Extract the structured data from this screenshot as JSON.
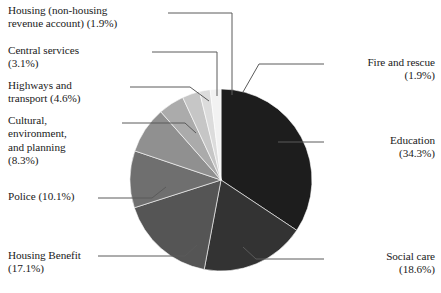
{
  "chart_data": {
    "type": "pie",
    "title": "",
    "legend_position": "callout-labels",
    "grid": false,
    "categories": [
      "Education",
      "Social care",
      "Housing Benefit",
      "Police",
      "Cultural, environment, and planning",
      "Highways and transport",
      "Central services",
      "Housing (non-housing revenue account)",
      "Fire and rescue"
    ],
    "values": [
      34.3,
      18.6,
      17.1,
      10.1,
      8.3,
      4.6,
      3.1,
      1.9,
      1.9
    ],
    "unit": "%",
    "slices": [
      {
        "label": "Education",
        "value": 34.3,
        "color": "#1d1d1d",
        "start_angle": 0,
        "end_angle": 123.48
      },
      {
        "label": "Social care",
        "value": 18.6,
        "color": "#333333",
        "start_angle": 123.48,
        "end_angle": 190.44
      },
      {
        "label": "Housing Benefit",
        "value": 17.1,
        "color": "#555555",
        "start_angle": 190.44,
        "end_angle": 252.0
      },
      {
        "label": "Police",
        "value": 10.1,
        "color": "#6f6f6f",
        "start_angle": 252.0,
        "end_angle": 288.36
      },
      {
        "label": "Cultural, environment, and planning",
        "value": 8.3,
        "color": "#909090",
        "start_angle": 288.36,
        "end_angle": 318.24
      },
      {
        "label": "Highways and transport",
        "value": 4.6,
        "color": "#ababab",
        "start_angle": 318.24,
        "end_angle": 334.8
      },
      {
        "label": "Central services",
        "value": 3.1,
        "color": "#c6c6c6",
        "start_angle": 334.8,
        "end_angle": 345.96
      },
      {
        "label": "Housing (non-housing revenue account)",
        "value": 1.9,
        "color": "#dcdcdc",
        "start_angle": 345.96,
        "end_angle": 352.8
      },
      {
        "label": "Fire and rescue",
        "value": 1.9,
        "color": "#f2f2f2",
        "start_angle": 352.8,
        "end_angle": 360.0
      }
    ]
  },
  "labels": {
    "housing_nhra": "Housing (non-housing\nrevenue account) (1.9%)",
    "central_services": "Central services\n(3.1%)",
    "highways": "Highways and\ntransport (4.6%)",
    "cultural": "Cultural,\nenvironment,\nand planning\n(8.3%)",
    "police": "Police (10.1%)",
    "housing_benefit": "Housing Benefit\n(17.1%)",
    "fire": "Fire and rescue\n(1.9%)",
    "education": "Education\n(34.3%)",
    "social_care": "Social care\n(18.6%)"
  },
  "colors": {
    "leader_line": "#5a5a5a",
    "background": "#ffffff",
    "text": "#1a1a1a"
  }
}
